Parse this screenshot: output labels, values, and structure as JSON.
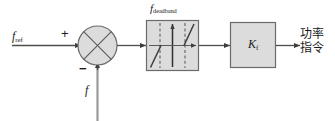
{
  "diagram": {
    "type": "control-block-diagram",
    "colors": {
      "background": "#ffffff",
      "line": "#4d4d4d",
      "block_fill": "#dcdcdc",
      "block_stroke": "#8c8c8c",
      "text": "#1a1a1a",
      "curve": "#5a5a5a",
      "dashed": "#6e6e6e"
    },
    "inputs": {
      "reference": {
        "symbol": "f",
        "subscript": "ref",
        "sign": "+"
      },
      "feedback": {
        "symbol": "f",
        "subscript": "",
        "sign": "-"
      }
    },
    "summing_junction": {
      "name": "summing-junction",
      "shape": "circle-with-x",
      "plus_label": "+",
      "minus_label": "−"
    },
    "deadband_block": {
      "name": "deadband-block",
      "label_symbol": "f",
      "label_subscript": "deadband",
      "description": "deadband nonlinearity characteristic"
    },
    "gain_block": {
      "name": "gain-block",
      "symbol": "K",
      "subscript": "f"
    },
    "output": {
      "line1": "功率",
      "line2": "指令"
    }
  }
}
